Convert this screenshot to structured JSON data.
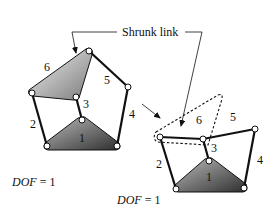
{
  "figure": {
    "callout_label": "Shrunk link",
    "left_mechanism": {
      "link_labels": [
        "1",
        "2",
        "3",
        "4",
        "5",
        "6"
      ],
      "dof_label": "DOF",
      "dof_equals": "= 1"
    },
    "right_mechanism": {
      "link_labels": [
        "1",
        "2",
        "3",
        "4",
        "5",
        "6"
      ],
      "dof_label": "DOF",
      "dof_equals": "= 1"
    },
    "colors": {
      "line": "#111111",
      "triangle_light": "#e6e6e6",
      "triangle_dark": "#4a4a4a",
      "joint_fill": "#ffffff"
    }
  }
}
